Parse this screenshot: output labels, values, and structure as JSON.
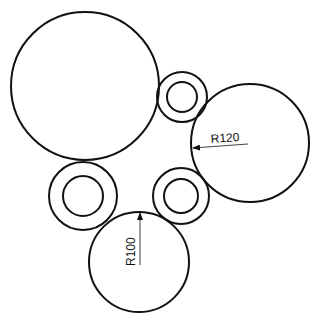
{
  "canvas": {
    "width": 317,
    "height": 320,
    "background": "#ffffff",
    "stroke": "#111111"
  },
  "circles": [
    {
      "id": "large-circle",
      "cx": 85,
      "cy": 86,
      "r": 74
    },
    {
      "id": "right-circle",
      "cx": 250,
      "cy": 143,
      "r": 59
    },
    {
      "id": "bottom-circle",
      "cx": 139,
      "cy": 262,
      "r": 50
    }
  ],
  "rings": [
    {
      "id": "top-ring",
      "cx": 182,
      "cy": 97,
      "r_outer": 25,
      "r_inner": 15
    },
    {
      "id": "left-ring",
      "cx": 83,
      "cy": 196,
      "r_outer": 34,
      "r_inner": 20
    },
    {
      "id": "middle-ring",
      "cx": 181,
      "cy": 196,
      "r_outer": 28,
      "r_inner": 17
    }
  ],
  "dimensions": {
    "r120": {
      "label": "R120",
      "x1": 248,
      "y1": 144,
      "x2": 193,
      "y2": 148,
      "text_x": 211,
      "text_y": 143
    },
    "r100": {
      "label": "R100",
      "x1": 140,
      "y1": 265,
      "x2": 140,
      "y2": 213,
      "text_x": 135,
      "text_y": 266
    }
  }
}
